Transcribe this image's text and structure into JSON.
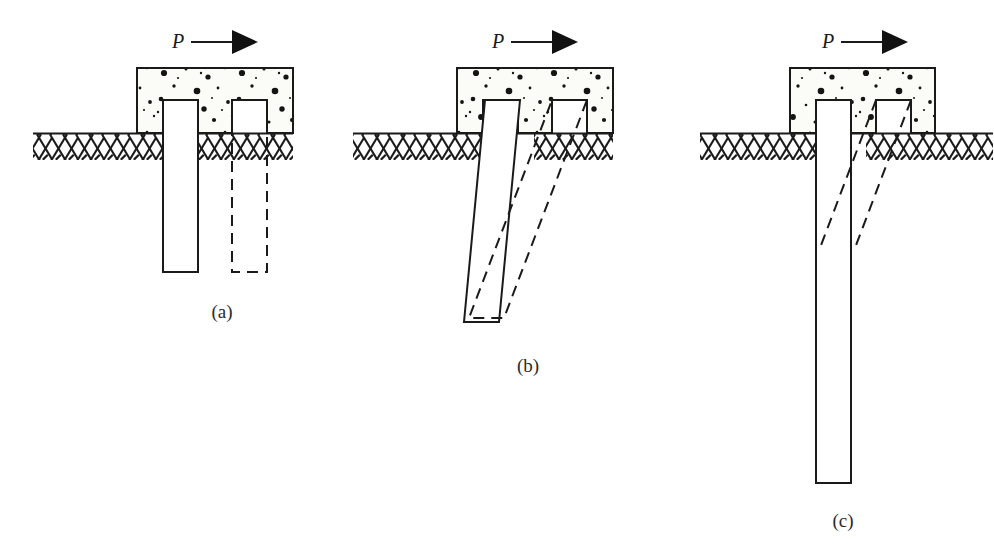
{
  "figure": {
    "caption_labels": [
      "(a)",
      "(b)",
      "(c)"
    ],
    "force_symbol": "P",
    "background_color": "#ffffff",
    "ink_color": "#1a1a1a",
    "concrete_fill": "#fbfbf8",
    "ground_fill": "#ffffff"
  },
  "panels": [
    {
      "id": "panel-a",
      "label": "(a)",
      "label_x": 222,
      "label_y": 318,
      "force_symbol": "P",
      "force_label_x": 172,
      "force_label_y": 48,
      "arrow": {
        "x1": 191,
        "y1": 42,
        "x2": 232,
        "y2": 42,
        "tip_x": 258,
        "half_height": 12
      },
      "cap": {
        "x": 137,
        "y": 68,
        "width": 156,
        "height": 65
      },
      "ground": {
        "x": 33,
        "y": 133,
        "width": 260,
        "height": 27
      },
      "pile_solid": {
        "x": 163,
        "y": 100,
        "width": 35,
        "height": 172
      },
      "pile_dashed": {
        "x": 232,
        "y": 100,
        "width": 35,
        "height": 172
      }
    },
    {
      "id": "panel-b",
      "label": "(b)",
      "label_x": 528,
      "label_y": 372,
      "force_symbol": "P",
      "force_label_x": 492,
      "force_label_y": 48,
      "arrow": {
        "x1": 511,
        "y1": 42,
        "x2": 552,
        "y2": 42,
        "tip_x": 578,
        "half_height": 12
      },
      "cap": {
        "x": 457,
        "y": 68,
        "width": 156,
        "height": 65
      },
      "ground": {
        "x": 353,
        "y": 133,
        "width": 260,
        "height": 27
      },
      "pile_solid_tilted": {
        "top_x": 485,
        "bottom_x": 464,
        "y_top": 100,
        "y_bottom": 322,
        "width": 35
      },
      "pile_dashed_tilted": {
        "top_x": 552,
        "bottom_x": 469,
        "y_top": 100,
        "y_bottom": 318,
        "width": 35
      }
    },
    {
      "id": "panel-c",
      "label": "(c)",
      "label_x": 843,
      "label_y": 527,
      "force_symbol": "P",
      "force_label_x": 822,
      "force_label_y": 48,
      "arrow": {
        "x1": 841,
        "y1": 42,
        "x2": 882,
        "y2": 42,
        "tip_x": 908,
        "half_height": 12
      },
      "cap": {
        "x": 790,
        "y": 68,
        "width": 145,
        "height": 65
      },
      "ground": {
        "x": 700,
        "y": 133,
        "width": 293,
        "height": 27
      },
      "pile_solid_long": {
        "x": 816,
        "y": 100,
        "width": 35,
        "height": 383
      },
      "pile_dashed_deflected": {
        "top_x": 876,
        "y_top": 100,
        "join_y": 248,
        "bottom_x": 820,
        "width": 35
      }
    }
  ],
  "legend_notes": {
    "solid_meaning": "original pile position",
    "dashed_meaning": "displaced pile position"
  }
}
